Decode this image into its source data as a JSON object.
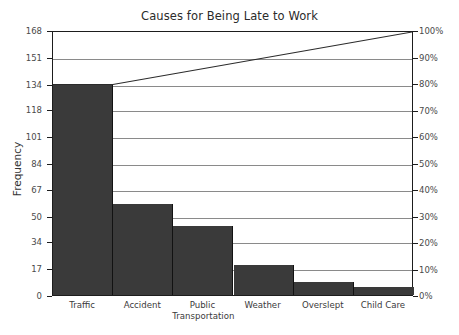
{
  "chart_data": {
    "type": "bar",
    "title": "Causes for Being Late to Work",
    "xlabel": "",
    "ylabel": "Frequency",
    "categories": [
      "Traffic",
      "Accident",
      "Public Transportation",
      "Weather",
      "Overslept",
      "Child Care"
    ],
    "values": [
      134,
      58,
      44,
      19,
      8,
      5
    ],
    "ylim": [
      0,
      168
    ],
    "yticks": [
      0,
      17,
      34,
      50,
      67,
      84,
      101,
      118,
      134,
      151,
      168
    ],
    "grid": true,
    "legend": "none",
    "secondary_axis": {
      "label": "",
      "ylim": [
        0,
        100
      ],
      "yticks": [
        "0%",
        "10%",
        "20%",
        "30%",
        "40%",
        "50%",
        "60%",
        "70%",
        "80%",
        "90%",
        "100%"
      ],
      "series": {
        "name": "Cumulative Percentage",
        "type": "line",
        "values": [
          80,
          84,
          88,
          92,
          96,
          100
        ]
      }
    },
    "bar_color": "#3a3a3a",
    "line_color": "#2b2b2b",
    "grid_color": "#8a8a8a",
    "axis_color": "#1d1d1d"
  },
  "xlabel_lines": [
    [
      "Traffic"
    ],
    [
      "Accident"
    ],
    [
      "Public",
      "Transportation"
    ],
    [
      "Weather"
    ],
    [
      "Overslept"
    ],
    [
      "Child Care"
    ]
  ]
}
